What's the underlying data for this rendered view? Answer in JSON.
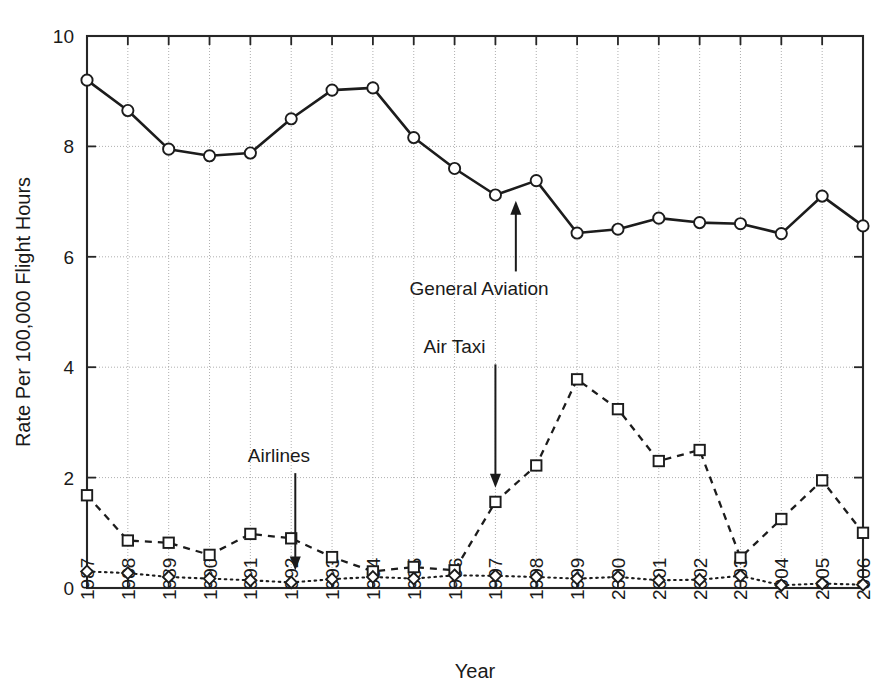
{
  "chart_data": {
    "type": "line",
    "title": "",
    "xlabel": "Year",
    "ylabel": "Rate Per 100,000 Flight Hours",
    "categories": [
      "1987",
      "1988",
      "1989",
      "1990",
      "1991",
      "1992",
      "1993",
      "1994",
      "1995",
      "1996",
      "1997",
      "1998",
      "1999",
      "2000",
      "2001",
      "2002",
      "2003",
      "2004",
      "2005",
      "2006"
    ],
    "x": [
      1987,
      1988,
      1989,
      1990,
      1991,
      1992,
      1993,
      1994,
      1995,
      1996,
      1997,
      1998,
      1999,
      2000,
      2001,
      2002,
      2003,
      2004,
      2005,
      2006
    ],
    "xlim": [
      1987,
      2006
    ],
    "ylim": [
      0,
      10
    ],
    "yticks": [
      0,
      2,
      4,
      6,
      8,
      10
    ],
    "ytick_labels": [
      "0",
      "2",
      "4",
      "6",
      "8",
      "10"
    ],
    "grid": true,
    "legend_position": "none-inline-annotations",
    "series": [
      {
        "name": "General Aviation",
        "marker": "circle",
        "linestyle": "solid",
        "values": [
          9.2,
          8.65,
          7.95,
          7.83,
          7.88,
          8.5,
          9.02,
          9.06,
          8.16,
          7.6,
          7.12,
          7.38,
          6.43,
          6.5,
          6.7,
          6.62,
          6.6,
          6.42,
          7.1,
          6.56
        ]
      },
      {
        "name": "Air Taxi",
        "marker": "square",
        "linestyle": "dashed",
        "values": [
          1.68,
          0.86,
          0.82,
          0.6,
          0.98,
          0.9,
          0.56,
          0.3,
          0.38,
          0.32,
          1.56,
          2.22,
          3.78,
          3.24,
          2.3,
          2.5,
          0.55,
          1.25,
          1.95,
          1.0
        ]
      },
      {
        "name": "Airlines",
        "marker": "diamond",
        "linestyle": "dotted",
        "values": [
          0.3,
          0.27,
          0.2,
          0.17,
          0.14,
          0.1,
          0.16,
          0.2,
          0.17,
          0.23,
          0.22,
          0.2,
          0.17,
          0.2,
          0.14,
          0.15,
          0.22,
          0.05,
          0.08,
          0.06
        ]
      }
    ],
    "annotations": [
      {
        "text": "General Aviation",
        "label_x": 1996.6,
        "label_y": 5.3,
        "arrow_to_x": 1997.5,
        "arrow_to_y": 7.05,
        "direction": "up"
      },
      {
        "text": "Air Taxi",
        "label_x": 1996.0,
        "label_y": 4.25,
        "arrow_to_x": 1997.0,
        "arrow_to_y": 1.78,
        "direction": "down"
      },
      {
        "text": "Airlines",
        "label_x": 1991.7,
        "label_y": 2.28,
        "arrow_to_x": 1992.1,
        "arrow_to_y": 0.28,
        "direction": "down"
      }
    ]
  },
  "colors": {
    "ink": "#1a1a1a",
    "grid": "#9a9a9a",
    "background": "#ffffff",
    "marker_fill": "#ffffff"
  }
}
